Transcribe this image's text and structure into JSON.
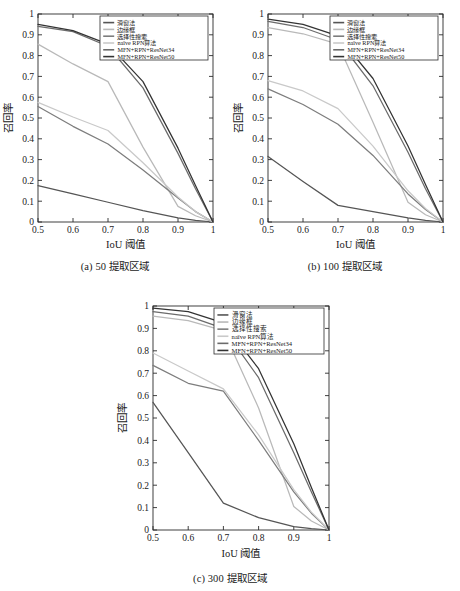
{
  "figure": {
    "panels": [
      {
        "id": "a",
        "caption": "(a) 50 提取区域"
      },
      {
        "id": "b",
        "caption": "(b) 100 提取区域"
      },
      {
        "id": "c",
        "caption": "(c) 300 提取区域"
      }
    ],
    "axis": {
      "xlabel": "IoU 阈值",
      "ylabel": "召回率",
      "xticks": [
        "0.5",
        "0.6",
        "0.7",
        "0.8",
        "0.9",
        "1"
      ],
      "yticks": [
        "0",
        "0.1",
        "0.2",
        "0.3",
        "0.4",
        "0.5",
        "0.6",
        "0.7",
        "0.8",
        "0.9",
        "1"
      ]
    },
    "legend": [
      {
        "label": "滑窗法",
        "color": "#555555"
      },
      {
        "label": "边缘框",
        "color": "#b9b9b9"
      },
      {
        "label": "选择性搜索",
        "color": "#7d7d7d"
      },
      {
        "label": "naïve RPN算法",
        "color": "#c9c9c9"
      },
      {
        "label": "MFN+RPN+ResNet34",
        "color": "#6b6b6b"
      },
      {
        "label": "MFN+RPN+ResNet50",
        "color": "#333333"
      }
    ]
  },
  "chart_data": [
    {
      "type": "line",
      "title": "(a) 50 提取区域",
      "xlabel": "IoU 阈值",
      "ylabel": "召回率",
      "xlim": [
        0.5,
        1.0
      ],
      "ylim": [
        0,
        1
      ],
      "xticks": [
        0.5,
        0.6,
        0.7,
        0.8,
        0.9,
        1.0
      ],
      "yticks": [
        0,
        0.1,
        0.2,
        0.3,
        0.4,
        0.5,
        0.6,
        0.7,
        0.8,
        0.9,
        1.0
      ],
      "grid": false,
      "legend_position": "upper right",
      "x": [
        0.5,
        0.6,
        0.7,
        0.8,
        0.9,
        0.95,
        1.0
      ],
      "series": [
        {
          "name": "滑窗法",
          "color": "#555555",
          "values": [
            0.175,
            0.135,
            0.095,
            0.055,
            0.02,
            0.008,
            0.0
          ]
        },
        {
          "name": "边缘框",
          "color": "#b9b9b9",
          "values": [
            0.855,
            0.76,
            0.675,
            0.36,
            0.075,
            0.03,
            0.0
          ]
        },
        {
          "name": "选择性搜索",
          "color": "#7d7d7d",
          "values": [
            0.555,
            0.46,
            0.375,
            0.25,
            0.115,
            0.05,
            0.0
          ]
        },
        {
          "name": "naïve RPN算法",
          "color": "#c9c9c9",
          "values": [
            0.575,
            0.505,
            0.44,
            0.285,
            0.12,
            0.05,
            0.0
          ]
        },
        {
          "name": "MFN+RPN+ResNet34",
          "color": "#6b6b6b",
          "values": [
            0.94,
            0.915,
            0.845,
            0.645,
            0.33,
            0.16,
            0.0
          ]
        },
        {
          "name": "MFN+RPN+ResNet50",
          "color": "#333333",
          "values": [
            0.95,
            0.92,
            0.855,
            0.675,
            0.355,
            0.175,
            0.0
          ]
        }
      ]
    },
    {
      "type": "line",
      "title": "(b) 100 提取区域",
      "xlabel": "IoU 阈值",
      "ylabel": "召回率",
      "xlim": [
        0.5,
        1.0
      ],
      "ylim": [
        0,
        1
      ],
      "xticks": [
        0.5,
        0.6,
        0.7,
        0.8,
        0.9,
        1.0
      ],
      "yticks": [
        0,
        0.1,
        0.2,
        0.3,
        0.4,
        0.5,
        0.6,
        0.7,
        0.8,
        0.9,
        1.0
      ],
      "grid": false,
      "legend_position": "upper right",
      "x": [
        0.5,
        0.6,
        0.7,
        0.8,
        0.9,
        0.95,
        1.0
      ],
      "series": [
        {
          "name": "滑窗法",
          "color": "#555555",
          "values": [
            0.315,
            0.195,
            0.08,
            0.05,
            0.02,
            0.008,
            0.0
          ]
        },
        {
          "name": "边缘框",
          "color": "#b9b9b9",
          "values": [
            0.935,
            0.905,
            0.855,
            0.48,
            0.095,
            0.035,
            0.0
          ]
        },
        {
          "name": "选择性搜索",
          "color": "#7d7d7d",
          "values": [
            0.64,
            0.565,
            0.47,
            0.32,
            0.135,
            0.06,
            0.0
          ]
        },
        {
          "name": "naïve RPN算法",
          "color": "#c9c9c9",
          "values": [
            0.68,
            0.63,
            0.545,
            0.365,
            0.15,
            0.065,
            0.0
          ]
        },
        {
          "name": "MFN+RPN+ResNet34",
          "color": "#6b6b6b",
          "values": [
            0.965,
            0.935,
            0.875,
            0.655,
            0.335,
            0.16,
            0.0
          ]
        },
        {
          "name": "MFN+RPN+ResNet50",
          "color": "#333333",
          "values": [
            0.975,
            0.95,
            0.895,
            0.69,
            0.365,
            0.18,
            0.0
          ]
        }
      ]
    },
    {
      "type": "line",
      "title": "(c) 300 提取区域",
      "xlabel": "IoU 阈值",
      "ylabel": "召回率",
      "xlim": [
        0.5,
        1.0
      ],
      "ylim": [
        0,
        1
      ],
      "xticks": [
        0.5,
        0.6,
        0.7,
        0.8,
        0.9,
        1.0
      ],
      "yticks": [
        0,
        0.1,
        0.2,
        0.3,
        0.4,
        0.5,
        0.6,
        0.7,
        0.8,
        0.9,
        1.0
      ],
      "grid": false,
      "legend_position": "upper right",
      "x": [
        0.5,
        0.6,
        0.7,
        0.8,
        0.9,
        0.95,
        1.0
      ],
      "series": [
        {
          "name": "滑窗法",
          "color": "#555555",
          "values": [
            0.57,
            0.345,
            0.12,
            0.055,
            0.015,
            0.006,
            0.0
          ]
        },
        {
          "name": "边缘框",
          "color": "#b9b9b9",
          "values": [
            0.955,
            0.935,
            0.89,
            0.545,
            0.105,
            0.04,
            0.0
          ]
        },
        {
          "name": "选择性搜索",
          "color": "#7d7d7d",
          "values": [
            0.735,
            0.655,
            0.62,
            0.4,
            0.17,
            0.075,
            0.0
          ]
        },
        {
          "name": "naïve RPN算法",
          "color": "#c9c9c9",
          "values": [
            0.79,
            0.71,
            0.63,
            0.425,
            0.18,
            0.08,
            0.0
          ]
        },
        {
          "name": "MFN+RPN+ResNet34",
          "color": "#6b6b6b",
          "values": [
            0.975,
            0.955,
            0.9,
            0.68,
            0.345,
            0.17,
            0.0
          ]
        },
        {
          "name": "MFN+RPN+ResNet50",
          "color": "#333333",
          "values": [
            0.99,
            0.975,
            0.925,
            0.72,
            0.385,
            0.19,
            0.0
          ]
        }
      ]
    }
  ]
}
